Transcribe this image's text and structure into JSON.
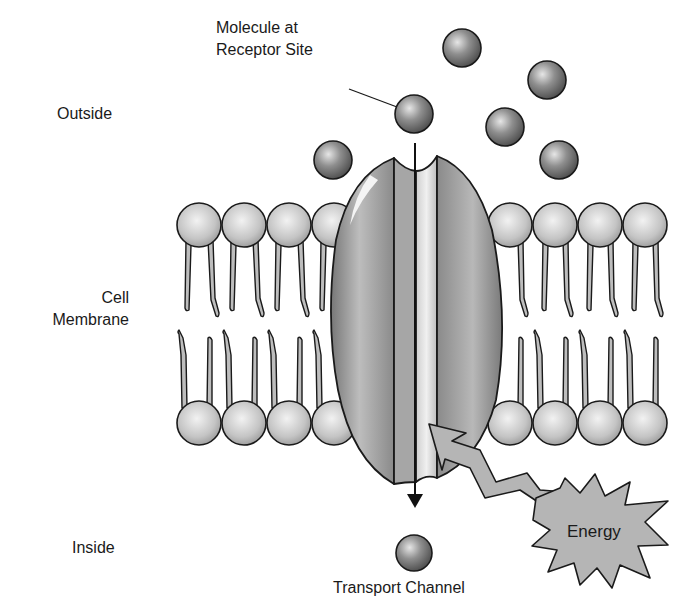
{
  "labels": {
    "molecule_line1": "Molecule at",
    "molecule_line2": "Receptor Site",
    "outside": "Outside",
    "cell_line1": "Cell",
    "cell_line2": "Membrane",
    "inside": "Inside",
    "transport_channel": "Transport Channel",
    "energy": "Energy"
  },
  "colors": {
    "outline": "#1a1a1a",
    "molecule_dark": "#555555",
    "molecule_light": "#cfcfcf",
    "head_light": "#eeeeee",
    "head_dark": "#9a9a9a",
    "tail_fill": "#bdbdbd",
    "protein_dark": "#7c7c7c",
    "protein_light": "#c4c4c4",
    "energy_fill": "#b5b5b5"
  }
}
